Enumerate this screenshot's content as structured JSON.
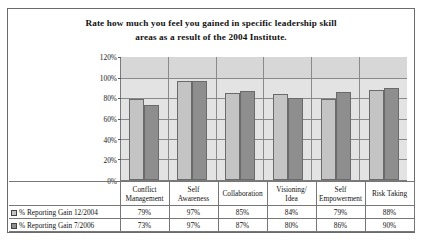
{
  "chart_data": {
    "type": "bar",
    "title": "Rate how much you feel you gained in specific leadership skill areas as a result of the 2004 Institute.",
    "title_line1": "Rate how much you feel you gained in specific leadership skill",
    "title_line2": "areas as a result of the 2004 Institute.",
    "xlabel": "",
    "ylabel": "",
    "ylim": [
      0,
      120
    ],
    "ytick_labels": [
      "0%",
      "20%",
      "40%",
      "60%",
      "80%",
      "100%",
      "120%"
    ],
    "ytick_values": [
      0,
      20,
      40,
      60,
      80,
      100,
      120
    ],
    "grid": true,
    "legend_position": "data-table-left",
    "categories": [
      "Conflict Management",
      "Self Awareness",
      "Collaboration",
      "Visioning/ Idea",
      "Self Empowerment",
      "Risk Taking"
    ],
    "category_lines": [
      [
        "Conflict",
        "Management"
      ],
      [
        "Self",
        "Awareness"
      ],
      [
        "Collaboration",
        ""
      ],
      [
        "Visioning/",
        "Idea"
      ],
      [
        "Self",
        "Empowerment"
      ],
      [
        "Risk Taking",
        ""
      ]
    ],
    "series": [
      {
        "name": "% Reporting Gain 12/2004",
        "color": "#c4c4c4",
        "values": [
          79,
          97,
          85,
          84,
          79,
          88
        ],
        "labels": [
          "79%",
          "97%",
          "85%",
          "84%",
          "79%",
          "88%"
        ]
      },
      {
        "name": "% Reporting Gain 7/2006",
        "color": "#8e8e8e",
        "values": [
          73,
          97,
          87,
          80,
          86,
          90
        ],
        "labels": [
          "73%",
          "97%",
          "87%",
          "80%",
          "86%",
          "90%"
        ]
      }
    ]
  },
  "colors": {
    "series_a": "#c4c4c4",
    "series_b": "#8e8e8e",
    "plot_background_upper": "#d7d7d7",
    "plot_background_lower": "#e3e3e3",
    "frame_border": "#6b6b6b"
  }
}
